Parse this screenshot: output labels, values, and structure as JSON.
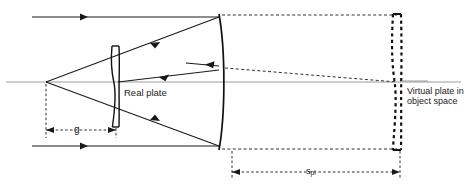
{
  "figure": {
    "type": "optical-ray-diagram",
    "width": 467,
    "height": 192,
    "background_color": "#ffffff"
  },
  "labels": {
    "real_plate": "Real plate",
    "virtual_plate": "Virtual plate in object space",
    "dimension_g": "g",
    "dimension_spl_base": "s",
    "dimension_spl_sub": "pl"
  },
  "colors": {
    "ray": "#1a1a1a",
    "optical_axis": "#9a9a9a",
    "element_outline": "#111111",
    "virtual_outline": "#111111",
    "dimension_line": "#1a1a1a",
    "text": "#1a1a1a"
  },
  "geometry": {
    "optical_axis_y": 82,
    "focal_point": {
      "x": 46,
      "y": 82
    },
    "real_plate": {
      "x": 115,
      "top_y": 46,
      "bottom_y": 127
    },
    "mirror": {
      "x": 219,
      "top_y": 14,
      "bottom_y": 150
    },
    "virtual_plate": {
      "x": 396,
      "top_y": 14,
      "bottom_y": 150
    },
    "dimension_g": {
      "x_start": 46,
      "x_end": 115,
      "y": 130
    },
    "dimension_spl": {
      "x_start": 232,
      "x_end": 400,
      "y": 172
    }
  },
  "elements": {
    "incoming_ray_top": "horizontal ray entering from left at top",
    "incoming_ray_bottom": "horizontal ray entering from left at bottom",
    "converging_rays": "rays reflected by mirror converging to focal point",
    "virtual_projection_lines": "dashed lines from mirror edges to virtual plate"
  }
}
